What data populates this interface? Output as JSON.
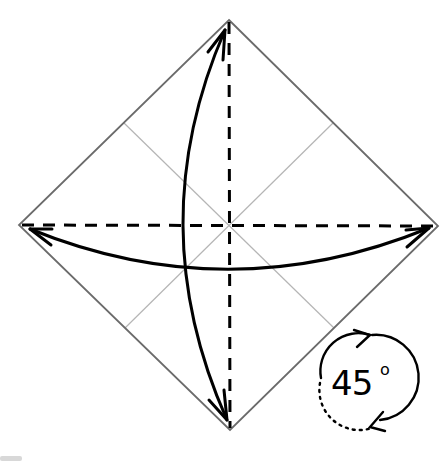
{
  "diagram": {
    "square": {
      "top": [
        229,
        20
      ],
      "left": [
        19,
        225
      ],
      "right": [
        438,
        226
      ],
      "bottom": [
        230,
        430
      ],
      "edge_color": "#6b6b6b"
    },
    "crease_lines": {
      "color": "#b5b5b5",
      "description": "light precrease lines joining edge midpoints"
    },
    "fold_lines": {
      "style": "dashed",
      "color": "#000000",
      "items": [
        "vertical diagonal (top to bottom)",
        "horizontal diagonal (left to right)"
      ]
    },
    "arrows": [
      {
        "name": "vertical-fold-arrow",
        "type": "double-headed curved",
        "from": "top corner",
        "to": "bottom corner"
      },
      {
        "name": "horizontal-fold-arrow",
        "type": "double-headed curved",
        "from": "left corner",
        "to": "right corner"
      }
    ],
    "rotation": {
      "value": "45",
      "unit": "°",
      "symbol_text": "45",
      "degree_symbol": "o"
    }
  }
}
